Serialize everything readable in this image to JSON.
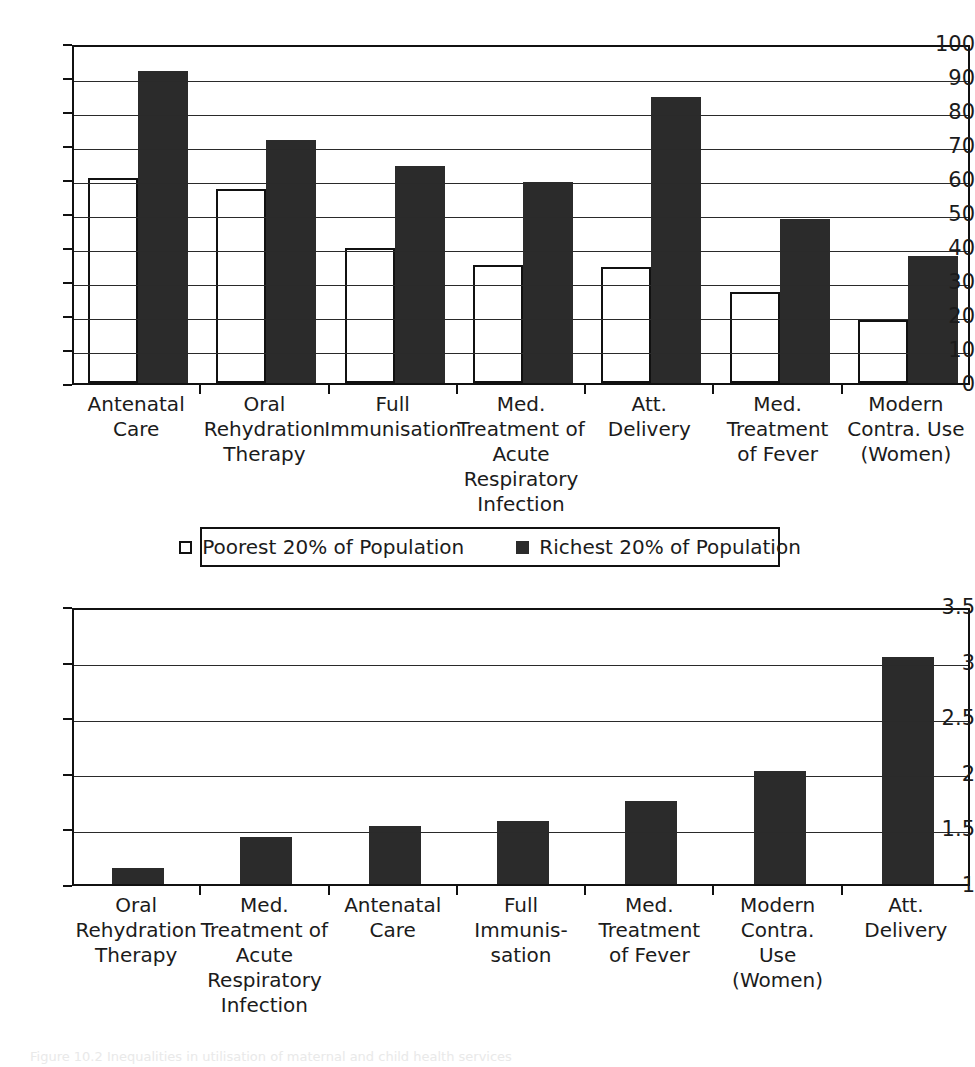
{
  "figure": {
    "caption": "Figure 10.2  Inequalities in utilisation of maternal and child health services"
  },
  "legend": {
    "entries": [
      {
        "label": "Poorest 20% of Population",
        "swatch": "open-square-icon",
        "color": "#ffffff"
      },
      {
        "label": "Richest 20% of Population",
        "swatch": "filled-square-icon",
        "color": "#2b2b2b"
      }
    ]
  },
  "chart_data": [
    {
      "type": "bar",
      "title": "",
      "xlabel": "",
      "ylabel": "",
      "ylim": [
        0,
        100
      ],
      "yticks": [
        0,
        10,
        20,
        30,
        40,
        50,
        60,
        70,
        80,
        90,
        100
      ],
      "ytick_labels": [
        "0",
        "10",
        "20",
        "30",
        "40",
        "50",
        "60",
        "70",
        "80",
        "90",
        "100"
      ],
      "grid": true,
      "legend_position": "below",
      "categories": [
        "Antenatal Care",
        "Oral Rehydration Therapy",
        "Full Immunisation",
        "Med. Treatment of Acute Respiratory Infection",
        "Att. Delivery",
        "Med. Treatment of Fever",
        "Modern Contra. Use (Women)"
      ],
      "category_lines": [
        [
          "Antenatal",
          "Care"
        ],
        [
          "Oral",
          "Rehydration",
          "Therapy"
        ],
        [
          "Full",
          "Immunisation"
        ],
        [
          "Med.",
          "Treatment of",
          "Acute",
          "Respiratory",
          "Infection"
        ],
        [
          "Att.",
          "Delivery"
        ],
        [
          "Med.",
          "Treatment",
          "of Fever"
        ],
        [
          "Modern",
          "Contra. Use",
          "(Women)"
        ]
      ],
      "series": [
        {
          "name": "Poorest 20% of Population",
          "values": [
            60.3,
            57.0,
            39.8,
            34.6,
            34.0,
            26.8,
            18.5
          ]
        },
        {
          "name": "Richest 20% of Population",
          "values": [
            91.8,
            71.4,
            63.7,
            59.2,
            84.0,
            48.2,
            37.3
          ]
        }
      ]
    },
    {
      "type": "bar",
      "title": "",
      "xlabel": "",
      "ylabel": "",
      "ylim": [
        1,
        3.5
      ],
      "yticks": [
        1,
        1.5,
        2,
        2.5,
        3,
        3.5
      ],
      "ytick_labels": [
        "1",
        "1.5",
        "2",
        "2.5",
        "3",
        "3.5"
      ],
      "grid": true,
      "legend_position": "none",
      "categories": [
        "Oral Rehydration Therapy",
        "Med. Treatment of Acute Respiratory Infection",
        "Antenatal Care",
        "Full Immunis-sation",
        "Med. Treatment of Fever",
        "Modern Contra. Use (Women)",
        "Att. Delivery"
      ],
      "category_lines": [
        [
          "Oral",
          "Rehydration",
          "Therapy"
        ],
        [
          "Med.",
          "Treatment of",
          "Acute",
          "Respiratory",
          "Infection"
        ],
        [
          "Antenatal",
          "Care"
        ],
        [
          "Full",
          "Immunis-",
          "sation"
        ],
        [
          "Med.",
          "Treatment",
          "of Fever"
        ],
        [
          "Modern",
          "Contra.",
          "Use",
          "(Women)"
        ],
        [
          "Att.",
          "Delivery"
        ]
      ],
      "series": [
        {
          "name": "Richest / Poorest ratio",
          "values": [
            1.14,
            1.42,
            1.52,
            1.57,
            1.75,
            2.02,
            3.04
          ]
        }
      ]
    }
  ],
  "colors": {
    "bar_rich": "#2b2b2b",
    "bar_poor": "#ffffff",
    "axis": "#111111",
    "grid": "#2a2a2a",
    "text": "#1b1b1b"
  }
}
